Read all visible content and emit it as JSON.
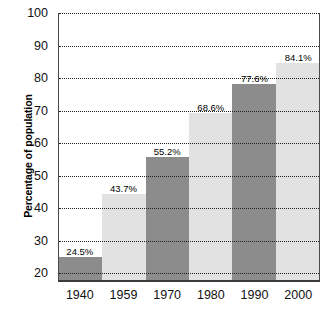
{
  "chart_data": {
    "type": "bar",
    "title": "",
    "subtitle": "",
    "xlabel": "",
    "ylabel": "Percentage of population",
    "categories": [
      "1940",
      "1959",
      "1970",
      "1980",
      "1990",
      "2000"
    ],
    "values": [
      24.5,
      43.7,
      55.2,
      68.6,
      77.6,
      84.1
    ],
    "value_labels": [
      "24.5%",
      "43.7%",
      "55.2%",
      "68.6%",
      "77.6%",
      "84.1%"
    ],
    "ylim": [
      17.3,
      100
    ],
    "yticks": [
      100,
      90,
      80,
      70,
      60,
      50,
      40,
      30,
      20
    ],
    "ytick_labels": [
      "100",
      "90",
      "80",
      "70",
      "60",
      "50",
      "40",
      "30",
      "20"
    ],
    "gridlines": [
      100,
      90,
      80,
      70,
      60,
      50,
      40,
      30,
      20
    ],
    "grid": true,
    "grid_style": "dotted",
    "legend": null,
    "legend_position": "none",
    "series": [
      {
        "name": "Percentage of population",
        "values": [
          24.5,
          43.7,
          55.2,
          68.6,
          77.6,
          84.1
        ]
      }
    ],
    "bar_colors": [
      "#8c8c8c",
      "#e2e2e2",
      "#8c8c8c",
      "#e2e2e2",
      "#8c8c8c",
      "#e2e2e2"
    ],
    "colors": {
      "bar_dark": "#8c8c8c",
      "bar_light": "#e2e2e2",
      "grid": "#202020",
      "axis": "#3a3a3a",
      "background": "#ffffff",
      "text": "#111111"
    }
  }
}
